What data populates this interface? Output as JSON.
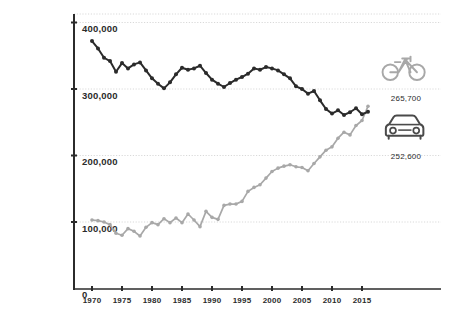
{
  "chart_data": {
    "type": "line",
    "title": "",
    "subtitle": "",
    "xlabel": "",
    "ylabel": "",
    "xlim": [
      1969,
      2017
    ],
    "ylim": [
      0,
      415000
    ],
    "grid": true,
    "grid_axis": "y",
    "legend_position": "right-inline-icons",
    "y_ticks": [
      0,
      100000,
      200000,
      300000,
      400000
    ],
    "y_tick_labels": [
      "0",
      "100,000",
      "200,000",
      "300,000",
      "400,000"
    ],
    "x_ticks": [
      1970,
      1975,
      1980,
      1985,
      1990,
      1995,
      2000,
      2005,
      2010,
      2015
    ],
    "x_tick_labels": [
      "1970",
      "1975",
      "1980",
      "1985",
      "1990",
      "1995",
      "2000",
      "2005",
      "2010",
      "2015"
    ],
    "x": [
      1970,
      1971,
      1972,
      1973,
      1974,
      1975,
      1976,
      1977,
      1978,
      1979,
      1980,
      1981,
      1982,
      1983,
      1984,
      1985,
      1986,
      1987,
      1988,
      1989,
      1990,
      1991,
      1992,
      1993,
      1994,
      1995,
      1996,
      1997,
      1998,
      1999,
      2000,
      2001,
      2002,
      2003,
      2004,
      2005,
      2006,
      2007,
      2008,
      2009,
      2010,
      2011,
      2012,
      2013,
      2014,
      2015,
      2016
    ],
    "series": [
      {
        "name": "bicycle",
        "color": "#2b2b2b",
        "marker": "circle",
        "end_value": 265700,
        "end_label": "265,700",
        "icon": "bicycle-icon",
        "values": [
          372000,
          361000,
          347000,
          342000,
          326000,
          339000,
          331000,
          337000,
          340000,
          328000,
          316000,
          308000,
          301000,
          310000,
          322000,
          332000,
          329000,
          331000,
          335000,
          324000,
          314000,
          308000,
          303000,
          309000,
          314000,
          318000,
          323000,
          331000,
          329000,
          333000,
          331000,
          328000,
          322000,
          316000,
          304000,
          300000,
          293000,
          297000,
          283000,
          270000,
          263000,
          268000,
          261000,
          265000,
          271000,
          262000,
          265700
        ]
      },
      {
        "name": "car",
        "color": "#a8a8a8",
        "marker": "circle",
        "end_value": 252600,
        "end_label": "252,600",
        "icon": "car-icon",
        "values": [
          103000,
          102000,
          100000,
          96000,
          83000,
          80000,
          90000,
          86000,
          79000,
          92000,
          99000,
          96000,
          105000,
          99000,
          106000,
          99000,
          112000,
          103000,
          93000,
          116000,
          107000,
          104000,
          125000,
          127000,
          127000,
          131000,
          146000,
          152000,
          156000,
          166000,
          176000,
          181000,
          184000,
          186000,
          183000,
          182000,
          177000,
          188000,
          198000,
          208000,
          213000,
          226000,
          235000,
          231000,
          245000,
          252600,
          274000
        ]
      }
    ]
  },
  "annotations": {
    "bike": {
      "icon_name": "bicycle-icon",
      "value_label": "265,700"
    },
    "car": {
      "icon_name": "car-icon",
      "value_label": "252,600"
    }
  },
  "colors": {
    "series_dark": "#2b2b2b",
    "series_light": "#a8a8a8",
    "axis": "#2b2b2b",
    "gridline": "#d9d9d9",
    "background": "#ffffff"
  }
}
